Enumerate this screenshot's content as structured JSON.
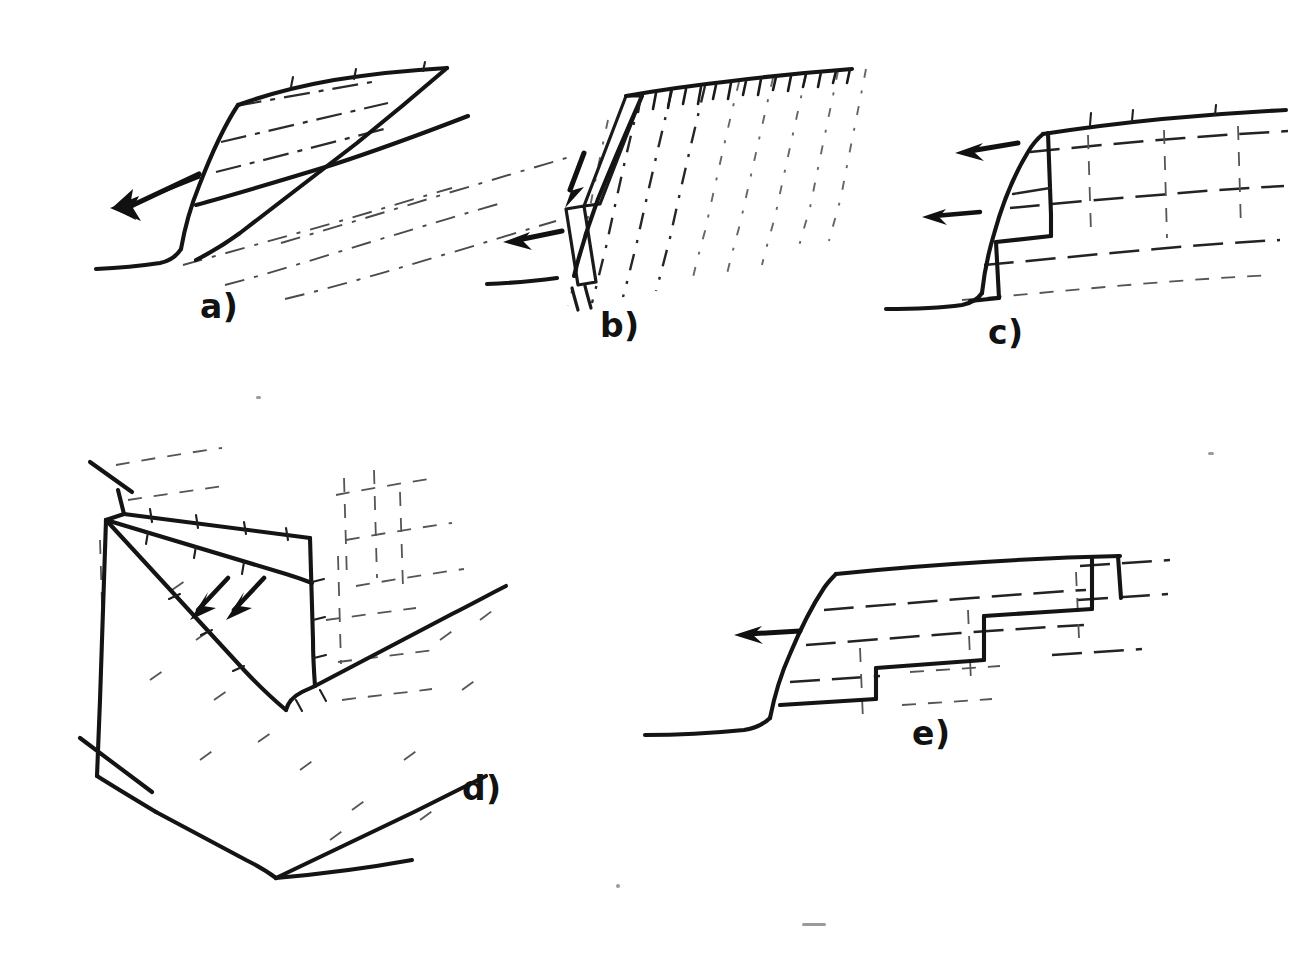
{
  "figure": {
    "kind": "line-drawing",
    "background_color": "#ffffff",
    "ink_color": "#141414",
    "width": 1314,
    "height": 955
  },
  "panels": [
    {
      "id": "a",
      "label": "a)",
      "label_x": 200,
      "label_y": 318,
      "failure_mode": "plane-failure",
      "arrow_count": 1,
      "arrow_direction": "down-left",
      "joint_set_count": 6,
      "joint_style": "dash-dot",
      "joint_orientation": "daylighting-dip-out-of-face"
    },
    {
      "id": "b",
      "label": "b)",
      "label_x": 600,
      "label_y": 337,
      "failure_mode": "toppling-failure",
      "arrow_count": 2,
      "arrow_direction": "down-left-and-left",
      "joint_set_count": 9,
      "joint_style": "steep-dashed",
      "crest_tick_count": 17
    },
    {
      "id": "c",
      "label": "c)",
      "label_x": 988,
      "label_y": 344,
      "failure_mode": "step-path-block-failure",
      "arrow_count": 2,
      "arrow_direction": "left",
      "joint_style": "dash-dot-horizontal-and-vertical",
      "step_count": 2
    },
    {
      "id": "d",
      "label": "d)",
      "label_x": 462,
      "label_y": 800,
      "failure_mode": "wedge-failure",
      "arrow_count": 2,
      "arrow_direction": "down-right-along-line-of-intersection",
      "joint_style": "faint-dash-dot",
      "geometry": "tetrahedral-wedge-in-valley-corner"
    },
    {
      "id": "e",
      "label": "e)",
      "label_x": 912,
      "label_y": 745,
      "failure_mode": "stepped-bedding-failure",
      "arrow_count": 1,
      "arrow_direction": "left",
      "joint_style": "dashed-horizontal-bedding",
      "step_count": 3
    }
  ],
  "legend_text": {
    "a_caption": "a)",
    "b_caption": "b)",
    "c_caption": "c)",
    "d_caption": "d)",
    "e_caption": "e)"
  }
}
